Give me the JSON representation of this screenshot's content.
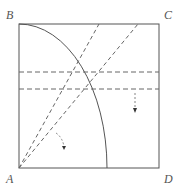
{
  "figure": {
    "type": "geometry-folding-diagram",
    "labels": {
      "top_left": "B",
      "top_right": "C",
      "bottom_left": "A",
      "bottom_right": "D"
    },
    "colors": {
      "stroke": "#555555",
      "dashed": "#555555",
      "background": "#ffffff"
    },
    "elements": [
      {
        "kind": "square",
        "corners": [
          "A",
          "B",
          "C",
          "D"
        ]
      },
      {
        "kind": "arc",
        "center": "A",
        "from": "B",
        "to": "bottom edge"
      },
      {
        "kind": "dashed-line",
        "from": "A",
        "to": "top edge",
        "count": 2
      },
      {
        "kind": "dashed-line",
        "orientation": "horizontal",
        "count": 2
      },
      {
        "kind": "fold-arrow",
        "count": 2
      }
    ]
  }
}
